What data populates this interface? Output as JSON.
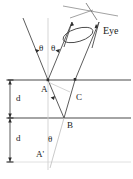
{
  "figure": {
    "type": "optical-ray-diagram",
    "width": 133,
    "height": 179,
    "background_color": "#ffffff",
    "stroke_color": "#3a3a3a",
    "faint_stroke_color": "#c8c8c8",
    "text_color": "#1a1a1a"
  },
  "labels": {
    "point_a": "A",
    "point_b": "B",
    "point_c": "C",
    "point_a_prime": "A'",
    "eye": "Eye",
    "theta_left": "θ",
    "theta_right": "θ",
    "theta_bottom": "θ",
    "thickness_upper": "d",
    "thickness_lower": "d"
  },
  "geometry": {
    "surface_top_y": 80,
    "surface_bottom_y": 118,
    "baseline_y": 162,
    "point_a": {
      "x": 48,
      "y": 80
    },
    "point_b": {
      "x": 64,
      "y": 118
    },
    "point_c": {
      "x": 75,
      "y": 80
    },
    "point_a_prime": {
      "x": 48,
      "y": 162
    },
    "dimension_x": 10,
    "incident_ray_start": {
      "x": 23,
      "y": 18
    },
    "reflected_ray_end": {
      "x": 99,
      "y": 28
    },
    "eye_cone_angle_deg": 28
  },
  "annotations": {
    "angle_marker_left": "arrow pointing to theta between normal and incident ray",
    "angle_marker_right": "arrow pointing to theta between normal and reflected ray",
    "dimension_style": "double-ended arrow bars",
    "eye_shape": "cylindrical beam with elliptical aperture"
  }
}
